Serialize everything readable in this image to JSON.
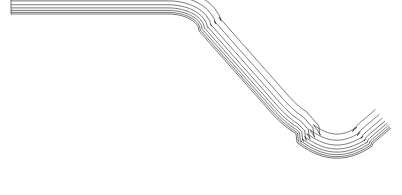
{
  "figure": {
    "title": "Finite element quadrilateral mesh of an embankment slope with V-notch valley",
    "type": "fe-mesh-2d",
    "background_color": "#ffffff",
    "line_color": "#1a1a1a",
    "boundary_color": "#000000",
    "interior_line_width": 0.6,
    "boundary_line_width": 1.8,
    "canvas": {
      "width": 402,
      "height": 195
    }
  },
  "domain_outline": {
    "description": "Closed polygon: flat crest at top-left, rounded shoulder, descending slope, rounded valley trough, rising slope to right peak, right edge down, flat base, left edge up",
    "points": [
      [
        11,
        179
      ],
      [
        11,
        14
      ],
      [
        168,
        14
      ],
      [
        181,
        16
      ],
      [
        191,
        22
      ],
      [
        199,
        31
      ],
      [
        300,
        143
      ],
      [
        312,
        152
      ],
      [
        324,
        157
      ],
      [
        336,
        158
      ],
      [
        348,
        155
      ],
      [
        359,
        148
      ],
      [
        391,
        128
      ],
      [
        391,
        179
      ]
    ]
  },
  "boundary_layer": {
    "present": true,
    "description": "Graded structured band of thin quadrilateral cells hugging every free surface (crest, shoulder, slope, trough, rising flank)",
    "layers": 7,
    "first_layer_thickness_px": 1.6,
    "growth_ratio": 1.25,
    "column_spacing_px": 3.2
  },
  "interior_mesh": {
    "description": "Unstructured graded quadrilateral paving, coarse near the base and left edge, refining toward the free surfaces and the valley trough",
    "coarse_cell_px": 26,
    "fine_cell_px": 7,
    "refinement_focus": [
      "valley-trough",
      "shoulder-curve",
      "slope-face"
    ]
  },
  "labels": {
    "crest": "",
    "slope": "",
    "valley": "",
    "base": ""
  }
}
